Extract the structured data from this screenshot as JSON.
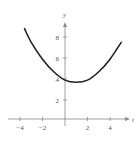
{
  "chart_data": {
    "type": "line",
    "title": "",
    "xlabel": "t",
    "ylabel": "y",
    "xlim": [
      -4.2,
      5.8
    ],
    "ylim": [
      -0.5,
      10
    ],
    "x_ticks": [
      -4,
      -2,
      2,
      4
    ],
    "y_ticks": [
      2,
      4,
      6,
      8
    ],
    "x_tick_labels": [
      "−4",
      "−2",
      "2",
      "4"
    ],
    "y_tick_labels": [
      "2",
      "4",
      "6",
      "8"
    ],
    "grid": false,
    "legend": null,
    "series": [
      {
        "name": "curve",
        "color": "#222222",
        "x": [
          -3.6,
          -3,
          -2,
          -1,
          0,
          1,
          2,
          3,
          4,
          5
        ],
        "y": [
          8.6,
          7.3,
          5.7,
          4.5,
          3.7,
          3.5,
          3.7,
          4.5,
          5.7,
          7.3
        ]
      }
    ]
  },
  "axes": {
    "x_label": "t",
    "y_label": "y",
    "x_ticks": [
      {
        "value": -4,
        "label": "−4"
      },
      {
        "value": -2,
        "label": "−2"
      },
      {
        "value": 2,
        "label": "2"
      },
      {
        "value": 4,
        "label": "4"
      }
    ],
    "y_ticks": [
      {
        "value": 2,
        "label": "2"
      },
      {
        "value": 4,
        "label": "4"
      },
      {
        "value": 6,
        "label": "6"
      },
      {
        "value": 8,
        "label": "8"
      }
    ]
  },
  "colors": {
    "axis": "#888888",
    "curve": "#222222",
    "text": "#555555"
  }
}
